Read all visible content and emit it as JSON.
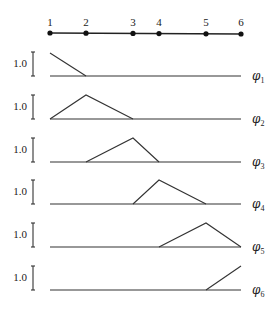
{
  "nodes": [
    {
      "label": "1",
      "x": 50
    },
    {
      "label": "2",
      "x": 86
    },
    {
      "label": "3",
      "x": 133
    },
    {
      "label": "4",
      "x": 159
    },
    {
      "label": "5",
      "x": 206
    },
    {
      "label": "6",
      "x": 241
    }
  ],
  "scale_label": "1.0",
  "basis_functions": [
    {
      "name": "φ",
      "subscript": "1",
      "baseline_y": 76,
      "points": [
        [
          50,
          53
        ],
        [
          86,
          76
        ]
      ]
    },
    {
      "name": "φ",
      "subscript": "2",
      "baseline_y": 119,
      "points": [
        [
          50,
          119
        ],
        [
          86,
          95
        ],
        [
          133,
          119
        ]
      ]
    },
    {
      "name": "φ",
      "subscript": "3",
      "baseline_y": 162,
      "points": [
        [
          86,
          162
        ],
        [
          133,
          138
        ],
        [
          159,
          162
        ]
      ]
    },
    {
      "name": "φ",
      "subscript": "4",
      "baseline_y": 204,
      "points": [
        [
          133,
          204
        ],
        [
          159,
          180
        ],
        [
          206,
          204
        ]
      ]
    },
    {
      "name": "φ",
      "subscript": "5",
      "baseline_y": 247,
      "points": [
        [
          159,
          247
        ],
        [
          206,
          223
        ],
        [
          241,
          247
        ]
      ]
    },
    {
      "name": "φ",
      "subscript": "6",
      "baseline_y": 290,
      "points": [
        [
          206,
          290
        ],
        [
          241,
          266
        ]
      ]
    }
  ],
  "colors": {
    "line": "#333333",
    "node": "#111111",
    "background": "#ffffff"
  }
}
